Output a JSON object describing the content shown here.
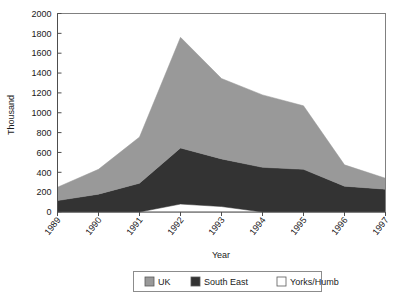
{
  "chart_data": {
    "type": "area",
    "stacked": true,
    "title": "",
    "xlabel": "Year",
    "ylabel": "Thousand",
    "categories": [
      "1989",
      "1990",
      "1991",
      "1992",
      "1993",
      "1994",
      "1995",
      "1996",
      "1997"
    ],
    "x": [
      1989,
      1990,
      1991,
      1992,
      1993,
      1994,
      1995,
      1996,
      1997
    ],
    "ylim": [
      0,
      2000
    ],
    "xlim": [
      1989,
      1997
    ],
    "ytick_labels": [
      "0",
      "200",
      "400",
      "600",
      "800",
      "1000",
      "1200",
      "1400",
      "1600",
      "1800",
      "2000"
    ],
    "yticks": [
      0,
      200,
      400,
      600,
      800,
      1000,
      1200,
      1400,
      1600,
      1800,
      2000
    ],
    "grid": false,
    "legend_position": "bottom",
    "series": [
      {
        "name": "Yorks/Humb",
        "color": "#ffffff",
        "values": [
          0,
          0,
          0,
          80,
          55,
          0,
          0,
          0,
          0
        ]
      },
      {
        "name": "South East",
        "color": "#333333",
        "values": [
          115,
          180,
          290,
          565,
          480,
          450,
          430,
          260,
          230
        ]
      },
      {
        "name": "UK",
        "color": "#999999",
        "values": [
          135,
          250,
          465,
          1115,
          810,
          730,
          640,
          215,
          110
        ]
      }
    ],
    "cumulative_totals": [
      250,
      430,
      755,
      1760,
      1345,
      1180,
      1070,
      475,
      340
    ],
    "annotations": []
  },
  "legend": {
    "items": [
      {
        "label": "UK",
        "color": "#999999"
      },
      {
        "label": "South East",
        "color": "#333333"
      },
      {
        "label": "Yorks/Humb",
        "color": "#ffffff"
      }
    ]
  },
  "axes": {
    "y_title": "Thousand",
    "x_title": "Year"
  }
}
